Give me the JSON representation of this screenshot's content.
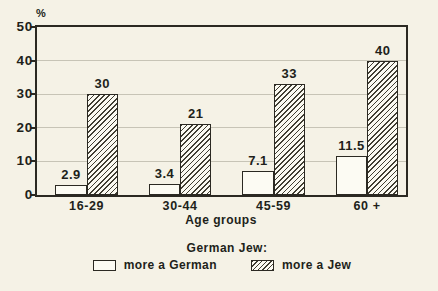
{
  "figure": {
    "background_color": "#f5f2e6",
    "frame_color": "#2b2922",
    "grid_color": "#c7c4b6",
    "bar_fill_color": "#fcfbf3",
    "hatch_line_color": "#413e33",
    "text_color": "#211f1a"
  },
  "chart_data": {
    "type": "bar",
    "title": "",
    "categories": [
      "16-29",
      "30-44",
      "45-59",
      "60 +"
    ],
    "series": [
      {
        "name": "more a German",
        "style": "plain",
        "values": [
          2.9,
          3.4,
          7.1,
          11.5
        ]
      },
      {
        "name": "more a Jew",
        "style": "hatched",
        "values": [
          30,
          21,
          33,
          40
        ]
      }
    ],
    "xlabel": "Age groups",
    "ylabel": "%",
    "ylim": [
      0,
      50
    ],
    "yticks": [
      0,
      10,
      20,
      30,
      40,
      50
    ],
    "grid": true,
    "legend_title": "German Jew:",
    "legend_position": "bottom",
    "value_labels_shown": true
  },
  "legend": {
    "title": "German Jew:",
    "items": [
      {
        "label": "more a German",
        "swatch": "plain"
      },
      {
        "label": "more a Jew",
        "swatch": "hatched"
      }
    ]
  }
}
